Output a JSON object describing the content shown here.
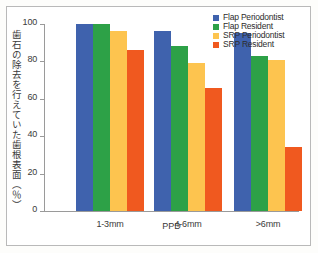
{
  "chart_data": {
    "type": "bar",
    "title": "",
    "xlabel": "PPD",
    "ylabel": "歯石の除去を行えていた歯根表面（％）",
    "categories": [
      "1-3mm",
      "4-6mm",
      ">6mm"
    ],
    "ylim": [
      0,
      100
    ],
    "yticks": [
      0,
      20,
      40,
      60,
      80,
      100
    ],
    "grid": false,
    "legend_position": "top-right",
    "series": [
      {
        "name": "Flap Periodontist",
        "color": "#3f62ad",
        "values": [
          100,
          96,
          95
        ]
      },
      {
        "name": "Flap Resident",
        "color": "#2da147",
        "values": [
          100,
          88,
          83
        ]
      },
      {
        "name": "SRP Periodontist",
        "color": "#fdc css",
        "values": [
          96,
          79,
          81
        ]
      },
      {
        "name": "SRP Resident",
        "color": "#f0591f",
        "values": [
          86,
          66,
          34
        ]
      }
    ]
  },
  "colors": {
    "flap_periodontist": "#3f62ad",
    "flap_resident": "#2da147",
    "srp_periodontist": "#fdc44f",
    "srp_resident": "#f0591f",
    "axis": "#9a9a9a",
    "text": "#3a3a3a",
    "frame": "#b9b9b9"
  },
  "legend": {
    "items": [
      {
        "label": "Flap Periodontist",
        "color": "#3f62ad"
      },
      {
        "label": "Flap Resident",
        "color": "#2da147"
      },
      {
        "label": "SRP Periodontist",
        "color": "#fdc44f"
      },
      {
        "label": "SRP Resident",
        "color": "#f0591f"
      }
    ]
  },
  "yticks": [
    {
      "label": "100",
      "value": 100
    },
    {
      "label": "80",
      "value": 80
    },
    {
      "label": "60",
      "value": 60
    },
    {
      "label": "40",
      "value": 40
    },
    {
      "label": "20",
      "value": 20
    },
    {
      "label": "0",
      "value": 0
    }
  ]
}
